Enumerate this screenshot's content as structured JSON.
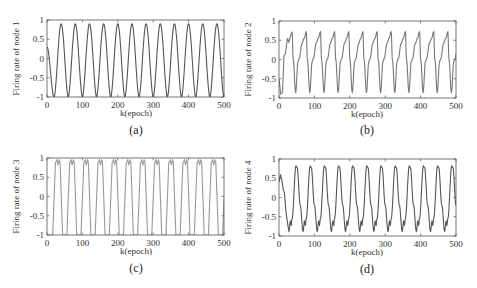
{
  "figure": {
    "panels": [
      {
        "id": "a",
        "caption": "(a)",
        "ylabel": "Firing rate of node 1",
        "xlabel": "k(epoch)",
        "frame": {
          "x": 47,
          "y": 20,
          "w": 177,
          "h": 77
        },
        "caption_pos": {
          "x": 136,
          "y": 134
        },
        "xlabel_pos": {
          "x": 136,
          "y": 116
        }
      },
      {
        "id": "b",
        "caption": "(b)",
        "ylabel": "Firing rate of node 2",
        "xlabel": "k(epoch)",
        "frame": {
          "x": 279,
          "y": 21,
          "w": 177,
          "h": 77
        },
        "caption_pos": {
          "x": 367,
          "y": 134
        },
        "xlabel_pos": {
          "x": 367,
          "y": 117
        }
      },
      {
        "id": "c",
        "caption": "(c)",
        "ylabel": "Firing rate of node 3",
        "xlabel": "k(epoch)",
        "frame": {
          "x": 47,
          "y": 158,
          "w": 177,
          "h": 77
        },
        "caption_pos": {
          "x": 136,
          "y": 272
        },
        "xlabel_pos": {
          "x": 136,
          "y": 254
        }
      },
      {
        "id": "d",
        "caption": "(d)",
        "ylabel": "Firing rate of node 4",
        "xlabel": "k(epoch)",
        "frame": {
          "x": 279,
          "y": 159,
          "w": 177,
          "h": 77
        },
        "caption_pos": {
          "x": 367,
          "y": 273
        },
        "xlabel_pos": {
          "x": 367,
          "y": 255
        }
      }
    ],
    "line_colors": {
      "a": "#555555",
      "b": "#777777",
      "c": "#999999",
      "d": "#555555"
    },
    "axis_color": "#555555"
  },
  "chart_data": [
    {
      "type": "line",
      "title": "",
      "caption": "(a)",
      "xlabel": "k(epoch)",
      "ylabel": "Firing rate of node 1",
      "xlim": [
        0,
        500
      ],
      "ylim": [
        -1,
        1
      ],
      "xticks": [
        0,
        100,
        200,
        300,
        400,
        500
      ],
      "yticks": [
        -1,
        -0.5,
        0,
        0.5,
        1
      ],
      "ytick_labels": [
        "-1",
        "-0.5",
        "0",
        "0.5",
        "1"
      ],
      "grid": false,
      "series": [
        {
          "name": "node 1",
          "description": "sustained oscillation, period ~40 epochs, starts ~0.3 at k=0 dropping to -1 at k~20",
          "period": 40,
          "max": 0.9,
          "min": -1.0,
          "peaks_x": [
            40,
            80,
            120,
            160,
            200,
            240,
            280,
            320,
            360,
            400,
            440,
            480
          ],
          "x": [
            0,
            10,
            20,
            30,
            40,
            50,
            60,
            70,
            80,
            100,
            120,
            140,
            160,
            180,
            200,
            220,
            240,
            260,
            280,
            300,
            320,
            340,
            360,
            380,
            400,
            420,
            440,
            460,
            480,
            500
          ],
          "values": [
            0.3,
            -0.8,
            -1.0,
            0.0,
            0.9,
            0.0,
            -1.0,
            0.0,
            0.9,
            -1.0,
            0.9,
            -1.0,
            0.9,
            -1.0,
            0.9,
            -1.0,
            0.9,
            -1.0,
            0.9,
            -1.0,
            0.9,
            -1.0,
            0.9,
            -1.0,
            0.9,
            -1.0,
            0.9,
            -1.0,
            0.9,
            -1.0
          ]
        }
      ]
    },
    {
      "type": "line",
      "title": "",
      "caption": "(b)",
      "xlabel": "k(epoch)",
      "ylabel": "Firing rate of node 2",
      "xlim": [
        0,
        500
      ],
      "ylim": [
        -1,
        1
      ],
      "xticks": [
        0,
        100,
        200,
        300,
        400,
        500
      ],
      "yticks": [
        -1,
        -0.5,
        0,
        0.5,
        1
      ],
      "ytick_labels": [
        "-1",
        "-0.5",
        "0",
        "0.5",
        "1"
      ],
      "grid": false,
      "series": [
        {
          "name": "node 2",
          "description": "sawtooth-like oscillation with shoulder near 0, period ~40 epochs; initial transient rising from -0.9 to ~0.7",
          "period": 40,
          "max": 0.72,
          "min": -0.85,
          "peaks_x": [
            37,
            78,
            118,
            158,
            198,
            238,
            278,
            318,
            358,
            398,
            438,
            478
          ],
          "x": [
            0,
            5,
            12,
            18,
            25,
            30,
            37,
            47,
            55,
            65,
            78,
            88,
            95,
            105,
            118,
            500
          ],
          "values": [
            -0.5,
            -0.9,
            0.1,
            0.2,
            0.55,
            0.45,
            0.72,
            -0.85,
            0.0,
            0.45,
            0.72,
            -0.85,
            0.0,
            0.45,
            0.72,
            0.0
          ]
        }
      ]
    },
    {
      "type": "line",
      "title": "",
      "caption": "(c)",
      "xlabel": "k(epoch)",
      "ylabel": "Firing rate of node 3",
      "xlim": [
        0,
        500
      ],
      "ylim": [
        -1,
        1
      ],
      "xticks": [
        0,
        100,
        200,
        300,
        400,
        500
      ],
      "yticks": [
        -1,
        -0.5,
        0,
        0.5,
        1
      ],
      "ytick_labels": [
        "-1",
        "-0.5",
        "0",
        "0.5",
        "1"
      ],
      "grid": false,
      "series": [
        {
          "name": "node 3",
          "description": "square-like wave saturating at -1 and ~0.95 with small M-shaped notch at top, period ~40 epochs",
          "period": 40,
          "max": 0.95,
          "min": -1.0,
          "plateau_notch": 0.82,
          "x": [
            0,
            15,
            25,
            30,
            35,
            40,
            45,
            55,
            65,
            70,
            75,
            80,
            85,
            95
          ],
          "values": [
            -1.0,
            -1.0,
            0.9,
            0.95,
            0.82,
            0.95,
            0.9,
            -1.0,
            0.9,
            0.95,
            0.82,
            0.95,
            0.9,
            -1.0
          ]
        }
      ]
    },
    {
      "type": "line",
      "title": "",
      "caption": "(d)",
      "xlabel": "k(epoch)",
      "ylabel": "Firing rate of node 4",
      "xlim": [
        0,
        500
      ],
      "ylim": [
        -1,
        1
      ],
      "xticks": [
        0,
        100,
        200,
        300,
        400,
        500
      ],
      "yticks": [
        -1,
        -0.5,
        0,
        0.5,
        1
      ],
      "ytick_labels": [
        "-1",
        "-0.5",
        "0",
        "0.5",
        "1"
      ],
      "grid": false,
      "series": [
        {
          "name": "node 4",
          "description": "oscillation with peaks ~0.82 and troughs ~-0.85 with small bump near -0.6, period ~40 epochs; initial transient from 0.6 down to -0.9",
          "period": 40,
          "max": 0.82,
          "min": -0.88,
          "peaks_x": [
            48,
            88,
            128,
            168,
            208,
            248,
            288,
            328,
            368,
            408,
            448,
            488
          ],
          "x": [
            0,
            5,
            12,
            20,
            28,
            35,
            48,
            65,
            72,
            78,
            88,
            500
          ],
          "values": [
            0.6,
            0.45,
            0.15,
            -0.6,
            -0.9,
            -0.65,
            0.82,
            -0.85,
            -0.6,
            -0.7,
            0.82,
            0.0
          ]
        }
      ]
    }
  ]
}
